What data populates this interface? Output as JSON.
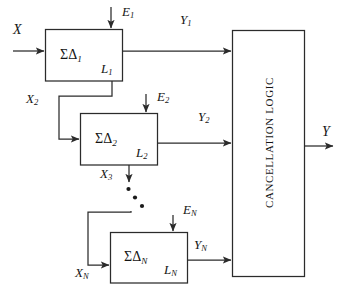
{
  "diagram": {
    "stroke_color": "#2b2b2b",
    "background_color": "#ffffff",
    "input": {
      "label": "X"
    },
    "output": {
      "label": "Y"
    },
    "stages": [
      {
        "name": "stage-1",
        "modulator_label": "ΣΔ",
        "modulator_sub": "1",
        "loop_label": "L",
        "loop_sub": "1",
        "error_label": "E",
        "error_sub": "1",
        "out_label": "Y",
        "out_sub": "1",
        "feed_label": "X",
        "feed_sub": "2"
      },
      {
        "name": "stage-2",
        "modulator_label": "ΣΔ",
        "modulator_sub": "2",
        "loop_label": "L",
        "loop_sub": "2",
        "error_label": "E",
        "error_sub": "2",
        "out_label": "Y",
        "out_sub": "2",
        "feed_label": "X",
        "feed_sub": "3"
      },
      {
        "name": "stage-n",
        "modulator_label": "ΣΔ",
        "modulator_sub": "N",
        "loop_label": "L",
        "loop_sub": "N",
        "error_label": "E",
        "error_sub": "N",
        "out_label": "Y",
        "out_sub": "N",
        "feed_label": "X",
        "feed_sub": "N"
      }
    ],
    "cancellation_block": {
      "label": "CANCELLATION LOGIC"
    },
    "ellipsis": {
      "label": "• • •",
      "count": 3
    }
  }
}
